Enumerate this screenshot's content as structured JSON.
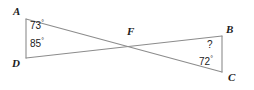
{
  "figure": {
    "type": "geometry-diagram",
    "background_color": "#ffffff",
    "line_color": "#8c8c8c",
    "text_color": "#1b1b1b",
    "vertices": [
      {
        "name": "A",
        "label": "A",
        "x": 26,
        "y": 19
      },
      {
        "name": "D",
        "label": "D",
        "x": 26,
        "y": 58
      },
      {
        "name": "F",
        "label": "F",
        "x": 128,
        "y": 45
      },
      {
        "name": "B",
        "label": "B",
        "x": 222,
        "y": 36
      },
      {
        "name": "C",
        "label": "C",
        "x": 222,
        "y": 72
      }
    ],
    "segments": [
      {
        "name": "segment-AD",
        "from": "A",
        "to": "D"
      },
      {
        "name": "segment-AC",
        "from": "A",
        "to": "C"
      },
      {
        "name": "segment-DB",
        "from": "D",
        "to": "B"
      },
      {
        "name": "segment-BC",
        "from": "B",
        "to": "C"
      }
    ],
    "angles": [
      {
        "name": "angle-A",
        "vertex": "A",
        "value": "73",
        "degree_symbol": "°",
        "known": true
      },
      {
        "name": "angle-D",
        "vertex": "D",
        "value": "85",
        "degree_symbol": "°",
        "known": true
      },
      {
        "name": "angle-B",
        "vertex": "B",
        "value": "?",
        "degree_symbol": "",
        "known": false
      },
      {
        "name": "angle-C",
        "vertex": "C",
        "value": "72",
        "degree_symbol": "°",
        "known": true
      }
    ]
  },
  "labels": {
    "vertex_a": "A",
    "vertex_b": "B",
    "vertex_c": "C",
    "vertex_d": "D",
    "vertex_f": "F",
    "angle_a": "73",
    "angle_a_deg": "°",
    "angle_d": "85",
    "angle_d_deg": "°",
    "angle_b": "?",
    "angle_c": "72",
    "angle_c_deg": "°"
  }
}
